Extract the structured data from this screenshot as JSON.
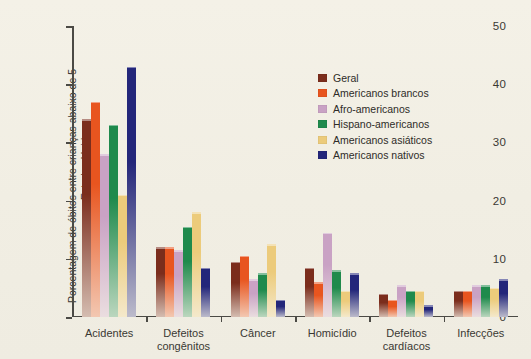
{
  "chart_data": {
    "type": "bar",
    "title": "",
    "xlabel": "",
    "ylabel": "Porcentagem de óbitos entre crianças abaixo de 5 anos nos Estados Unidos",
    "ylim": [
      0,
      50
    ],
    "yticks": [
      "0",
      "10",
      "20",
      "30",
      "40",
      "50"
    ],
    "grid": false,
    "legend_position": "upper-right-inside",
    "categories": [
      "Acidentes",
      "Defeitos\ncongênitos",
      "Câncer",
      "Homicídio",
      "Defeitos\ncardíacos",
      "Infecções"
    ],
    "series": [
      {
        "name": "Geral",
        "color": "#7b2d1c",
        "values": [
          34,
          12,
          9.5,
          8.5,
          4,
          4.5
        ]
      },
      {
        "name": "Americanos brancos",
        "color": "#e8551f",
        "values": [
          37,
          12,
          10.5,
          6,
          3,
          4.5
        ]
      },
      {
        "name": "Afro-americanos",
        "color": "#c9a2c4",
        "values": [
          28,
          11.5,
          6.5,
          14.5,
          5.5,
          5.5
        ]
      },
      {
        "name": "Hispano-americanos",
        "color": "#1f8a4c",
        "values": [
          33,
          15.5,
          7.5,
          8,
          4.5,
          5.5
        ]
      },
      {
        "name": "Americanos asiáticos",
        "color": "#eccb7b",
        "values": [
          21,
          18,
          12.5,
          4.5,
          4.5,
          5
        ]
      },
      {
        "name": "Americanos nativos",
        "color": "#23267a",
        "values": [
          43,
          8.5,
          3,
          7.5,
          2,
          6.5
        ]
      }
    ]
  },
  "legend": {
    "items": [
      {
        "label": "Geral",
        "color": "#7b2d1c"
      },
      {
        "label": "Americanos brancos",
        "color": "#e8551f"
      },
      {
        "label": "Afro-americanos",
        "color": "#c9a2c4"
      },
      {
        "label": "Hispano-americanos",
        "color": "#1f8a4c"
      },
      {
        "label": "Americanos asiáticos",
        "color": "#eccb7b"
      },
      {
        "label": "Americanos nativos",
        "color": "#23267a"
      }
    ]
  },
  "colors": {
    "background": "#f2efe4",
    "axis": "#4b4a45",
    "text": "#3a3833"
  }
}
